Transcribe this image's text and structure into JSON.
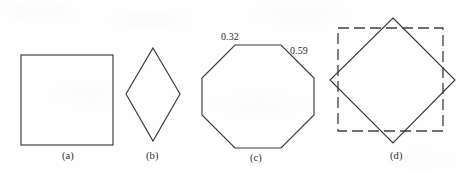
{
  "figure": {
    "background_color": "#fefefe",
    "stroke_color": "#3a3a3a",
    "width": 474,
    "height": 171,
    "panels": [
      {
        "id": "a",
        "caption": "(a)",
        "shape": "square",
        "caption_x": 62,
        "caption_y": 150
      },
      {
        "id": "b",
        "caption": "(b)",
        "shape": "rhombus",
        "caption_x": 146,
        "caption_y": 150
      },
      {
        "id": "c",
        "caption": "(c)",
        "shape": "octagon",
        "caption_x": 250,
        "caption_y": 152
      },
      {
        "id": "d",
        "caption": "(d)",
        "shape": "dashed-square-over-diamond",
        "caption_x": 390,
        "caption_y": 150
      }
    ],
    "edge_labels": [
      {
        "id": "octagon-upper-left-edge",
        "text": "0.32",
        "x": 221,
        "y": 31
      },
      {
        "id": "octagon-upper-right-edge",
        "text": "0.59",
        "x": 290,
        "y": 45
      }
    ],
    "geometry": {
      "square_a": {
        "x": 21,
        "y": 55,
        "width": 92,
        "height": 90
      },
      "rhombus_b": {
        "points": "153,48 180,94 153,141 126,94"
      },
      "octagon_c": {
        "points": "235,45 281,45 314,78 314,115 281,148 235,148 202,115 202,78"
      },
      "dashed_square_d": {
        "x": 338,
        "y": 28,
        "width": 105,
        "height": 103
      },
      "diamond_d": {
        "points": "393,18 455,80 393,143 330,80"
      }
    }
  }
}
